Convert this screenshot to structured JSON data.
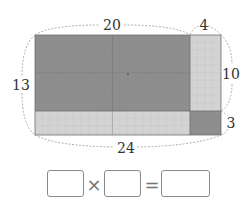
{
  "diagram": {
    "labels": {
      "top_left_width": "20",
      "top_right_width": "4",
      "left_height": "13",
      "right_upper_height": "10",
      "right_lower_height": "3",
      "bottom_width": "24"
    },
    "regions": {
      "big": {
        "cols": 20,
        "rows": 10,
        "shade": "dark"
      },
      "right_strip": {
        "cols": 4,
        "rows": 10,
        "shade": "light"
      },
      "bottom_strip": {
        "cols": 20,
        "rows": 3,
        "shade": "light"
      },
      "corner": {
        "cols": 4,
        "rows": 3,
        "shade": "dark"
      }
    },
    "colors": {
      "dark": "#8e8e8e",
      "light": "#d2d2d2",
      "grid_dark": "#7a7a7a",
      "grid_light": "#a8a8a8",
      "dashed": "#999999"
    }
  },
  "equation": {
    "operator_times": "×",
    "operator_equals": "=",
    "box1_value": "",
    "box2_value": "",
    "box3_value": ""
  }
}
